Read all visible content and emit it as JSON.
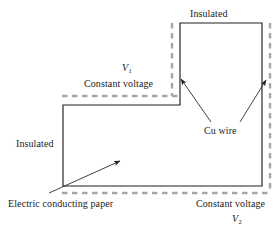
{
  "figure": {
    "kind": "schematic-diagram",
    "colors": {
      "outline": "#231f20",
      "dashed_boundary": "#a6a6a6",
      "text": "#1a1a1a",
      "background": "#ffffff"
    },
    "labels": {
      "insulated_top": "Insulated",
      "insulated_left": "Insulated",
      "constant_voltage_top": "Constant voltage",
      "constant_voltage_bottom": "Constant voltage",
      "v1": "V",
      "v1_sub": "1",
      "v2": "V",
      "v2_sub": "2",
      "cu_wire": "Cu wire",
      "electric_conducting_paper": "Electric conducting paper"
    },
    "geometry": {
      "outline_points": "180,23 262,23 262,186 63,186 63,105 180,105 180,23",
      "dashed_segments": [
        {
          "name": "cu-wire-upper-left",
          "x1": 172,
          "y1": 23,
          "x2": 172,
          "y2": 96
        },
        {
          "name": "cu-wire-right",
          "x1": 270,
          "y1": 23,
          "x2": 270,
          "y2": 193
        },
        {
          "name": "cu-wire-top-shelf",
          "x1": 62,
          "y1": 96,
          "x2": 179,
          "y2": 96
        },
        {
          "name": "cu-wire-bottom",
          "x1": 62,
          "y1": 193,
          "x2": 270,
          "y2": 193
        }
      ],
      "leaders": [
        {
          "name": "cu-wire-to-left-electrode",
          "x1": 211,
          "y1": 122,
          "x2": 180,
          "y2": 78
        },
        {
          "name": "cu-wire-to-right-electrode",
          "x1": 240,
          "y1": 122,
          "x2": 267,
          "y2": 79
        },
        {
          "name": "paper-to-interior",
          "x1": 49,
          "y1": 193,
          "x2": 121,
          "y2": 160
        }
      ]
    }
  }
}
